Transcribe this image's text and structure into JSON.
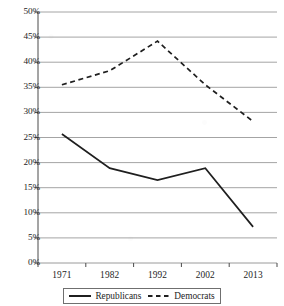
{
  "chart_data": {
    "type": "line",
    "title": "",
    "subtitle": "",
    "xlabel": "",
    "ylabel": "",
    "categories": [
      "1971",
      "1982",
      "1992",
      "2002",
      "2013"
    ],
    "series": [
      {
        "name": "Republicans",
        "values": [
          25.7,
          18.9,
          16.5,
          18.9,
          7.2
        ],
        "style": "solid",
        "color": "#1f1f1f"
      },
      {
        "name": "Democrats",
        "values": [
          35.5,
          38.3,
          44.2,
          35.5,
          28.2
        ],
        "style": "dashed",
        "color": "#1f1f1f"
      }
    ],
    "ylim": [
      0,
      50
    ],
    "ytick_values": [
      0,
      5,
      10,
      15,
      20,
      25,
      30,
      35,
      40,
      45,
      50
    ],
    "ytick_labels": [
      "0%",
      "5%",
      "10%",
      "15%",
      "20%",
      "25%",
      "30%",
      "35%",
      "40%",
      "45%",
      "50%"
    ],
    "xtick_labels": [
      "1971",
      "1982",
      "1992",
      "2002",
      "2013"
    ],
    "grid": true,
    "grid_axis": "y",
    "grid_color": "#9a9a9a",
    "legend": {
      "position": "bottom",
      "bordered": true,
      "entries": [
        {
          "label": "Republicans",
          "style": "solid"
        },
        {
          "label": "Democrats",
          "style": "dashed"
        }
      ]
    }
  }
}
